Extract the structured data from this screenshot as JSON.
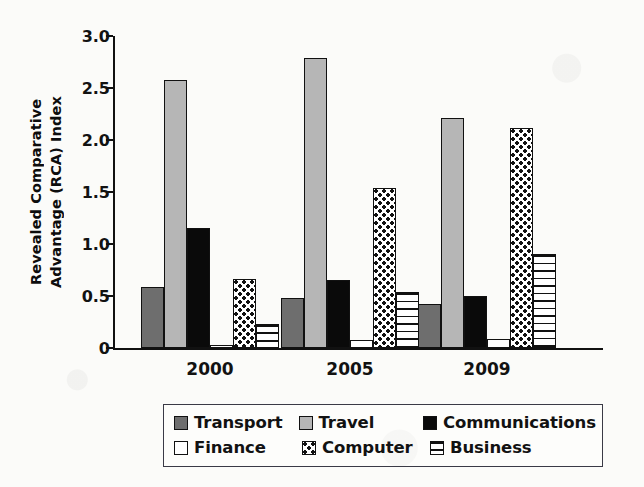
{
  "chart_data": {
    "type": "bar",
    "title": "",
    "xlabel": "",
    "ylabel": "Revealed Comparative Advantage (RCA) Index",
    "ylabel_line1": "Revealed Comparative",
    "ylabel_line2": "Advantage (RCA) Index",
    "categories": [
      "2000",
      "2005",
      "2009"
    ],
    "ylim": [
      0,
      3.0
    ],
    "yticks": [
      "0",
      "0.5",
      "1.0",
      "1.5",
      "2.0",
      "2.5",
      "3.0"
    ],
    "ytick_values": [
      0,
      0.5,
      1.0,
      1.5,
      2.0,
      2.5,
      3.0
    ],
    "grid": false,
    "legend_position": "bottom",
    "series": [
      {
        "name": "Transport",
        "pattern": "solid-dark-gray",
        "color": "#6e6e6e",
        "values": [
          0.59,
          0.48,
          0.42
        ]
      },
      {
        "name": "Travel",
        "pattern": "solid-light-gray",
        "color": "#b6b6b6",
        "values": [
          2.58,
          2.79,
          2.21
        ]
      },
      {
        "name": "Communications",
        "pattern": "solid-black",
        "color": "#0a0a0a",
        "values": [
          1.15,
          0.65,
          0.5
        ]
      },
      {
        "name": "Finance",
        "pattern": "solid-white",
        "color": "#ffffff",
        "values": [
          0.02,
          0.08,
          0.09
        ]
      },
      {
        "name": "Computer",
        "pattern": "dotted",
        "color": "#ffffff",
        "values": [
          0.66,
          1.54,
          2.12
        ]
      },
      {
        "name": "Business",
        "pattern": "horizontal-lines",
        "color": "#ffffff",
        "values": [
          0.23,
          0.54,
          0.9
        ]
      }
    ]
  },
  "legend": {
    "rows": [
      [
        {
          "label": "Transport",
          "swatch": "transport"
        },
        {
          "label": "Travel",
          "swatch": "travel"
        },
        {
          "label": "Communications",
          "swatch": "comms"
        }
      ],
      [
        {
          "label": "Finance",
          "swatch": "finance"
        },
        {
          "label": "Computer",
          "swatch": "computer"
        },
        {
          "label": "Business",
          "swatch": "business"
        }
      ]
    ]
  },
  "colors": {
    "axis": "#111111",
    "text": "#121212",
    "legend_border": "#3a3a46",
    "background": "#fbfbf9"
  }
}
